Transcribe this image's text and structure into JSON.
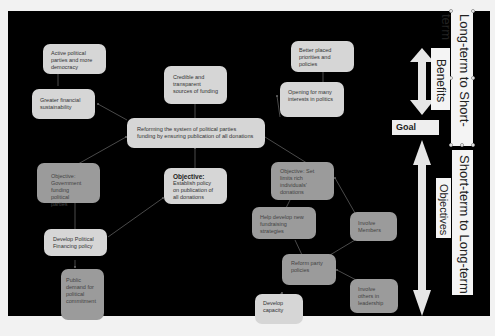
{
  "diagram": {
    "nodes": {
      "active_parties": "Active political parties and more democracy",
      "greater_sustainability": "Greater financial sustainability",
      "credible_funding": "Credible and transparent sources of funding",
      "better_priorities": "Better placed priorities and policies",
      "opening_interests": "Opening for many interests in politics",
      "goal_reform": "Reforming the system of political parties funding by ensuring publication of all donations",
      "obj_government_funding": "Objective: Government funding political parties",
      "obj_establish_policy_title": "Objective:",
      "obj_establish_policy_body": "Establish policy on publication of all donations",
      "obj_set_limits": "Objective: Set limits rich individuals' donations",
      "develop_financing_policy": "Develop Political Financing policy",
      "help_fundraising": "Help develop new fundraising strategies",
      "involve_members": "Involve Members",
      "reform_party_policies": "Reform party policies",
      "public_demand": "Public demand for political commitment",
      "develop_capacity": "Develop capacity",
      "involve_others": "Involve others in leadership"
    },
    "side_labels": {
      "long_to_short": "Long-term to Short-term",
      "benefits": "Benefits",
      "goal": "Goal",
      "short_to_long": "Short-term to Long-term",
      "objectives": "Objectives"
    },
    "colors": {
      "background": "#000000",
      "light_node": "#d6d6d6",
      "dark_node": "#9b9b9b",
      "arrow": "#e6e6e6",
      "page": "#f2f2f2"
    }
  }
}
